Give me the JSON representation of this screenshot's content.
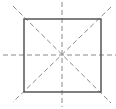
{
  "diagram": {
    "title": "Square with lines of symmetry",
    "shape": "square",
    "square": {
      "x": 24,
      "y": 19,
      "width": 77,
      "height": 73,
      "stroke": "#555555",
      "stroke_width": 1.5
    },
    "symmetry_lines": [
      {
        "name": "vertical",
        "x1": 62,
        "y1": 2,
        "x2": 62,
        "y2": 107
      },
      {
        "name": "horizontal",
        "x1": 3,
        "y1": 55,
        "x2": 116,
        "y2": 55
      },
      {
        "name": "diagonal-main",
        "x1": 13,
        "y1": 6,
        "x2": 111,
        "y2": 103
      },
      {
        "name": "diagonal-anti",
        "x1": 111,
        "y1": 7,
        "x2": 13,
        "y2": 102
      }
    ],
    "dash_color": "#8a8a8a",
    "dash_pattern": "5,3",
    "symmetry_line_count": 4
  }
}
